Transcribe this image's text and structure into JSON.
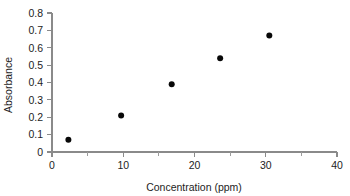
{
  "chart_data": {
    "type": "scatter",
    "title": "",
    "xlabel": "Concentration (ppm)",
    "ylabel": "Absorbance",
    "xlim": [
      0,
      40
    ],
    "ylim": [
      0,
      0.8
    ],
    "grid": false,
    "legend": null,
    "marker": {
      "shape": "circle",
      "color": "#080808",
      "size_px": 6
    },
    "x_ticks": [
      {
        "value": 0,
        "label": "0",
        "major": true
      },
      {
        "value": 5,
        "label": "",
        "major": false
      },
      {
        "value": 10,
        "label": "10",
        "major": true
      },
      {
        "value": 15,
        "label": "",
        "major": false
      },
      {
        "value": 20,
        "label": "20",
        "major": true
      },
      {
        "value": 25,
        "label": "",
        "major": false
      },
      {
        "value": 30,
        "label": "30",
        "major": true
      },
      {
        "value": 35,
        "label": "",
        "major": false
      },
      {
        "value": 40,
        "label": "40",
        "major": true
      }
    ],
    "y_ticks": [
      {
        "value": 0,
        "label": "0",
        "major": true
      },
      {
        "value": 0.1,
        "label": "0.1",
        "major": true
      },
      {
        "value": 0.2,
        "label": "0.2",
        "major": true
      },
      {
        "value": 0.3,
        "label": "0.3",
        "major": true
      },
      {
        "value": 0.4,
        "label": "0.4",
        "major": true
      },
      {
        "value": 0.5,
        "label": "0.5",
        "major": true
      },
      {
        "value": 0.6,
        "label": "0.6",
        "major": true
      },
      {
        "value": 0.7,
        "label": "0.7",
        "major": true
      },
      {
        "value": 0.8,
        "label": "0.8",
        "major": true
      }
    ],
    "x": [
      2.3,
      9.7,
      16.8,
      23.6,
      30.5
    ],
    "y": [
      0.07,
      0.21,
      0.39,
      0.54,
      0.67
    ],
    "points": [
      {
        "x": 2.3,
        "y": 0.07
      },
      {
        "x": 9.7,
        "y": 0.21
      },
      {
        "x": 16.8,
        "y": 0.39
      },
      {
        "x": 23.6,
        "y": 0.54
      },
      {
        "x": 30.5,
        "y": 0.67
      }
    ]
  },
  "colors": {
    "background": "#ffffff",
    "axis": "#8a8a8a",
    "text": "#1d1d1d",
    "marker": "#080808"
  }
}
